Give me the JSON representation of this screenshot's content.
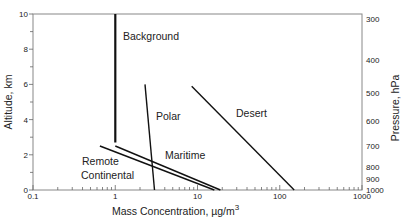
{
  "chart_data": {
    "type": "line",
    "title": "",
    "xlabel": "Mass Concentration, µg/m",
    "xlabel_superscript": "3",
    "ylabel": "Altitude, km",
    "y2label": "Pressure, hPa",
    "xscale": "log",
    "xlim": [
      0.1,
      1000
    ],
    "ylim": [
      0,
      10
    ],
    "grid": false,
    "legend": "none (inline labels)",
    "x_ticks": [
      {
        "value": 0.1,
        "label": "0.1"
      },
      {
        "value": 1,
        "label": "1"
      },
      {
        "value": 10,
        "label": "10"
      },
      {
        "value": 100,
        "label": "100"
      },
      {
        "value": 1000,
        "label": "1000"
      }
    ],
    "y_ticks": [
      {
        "value": 0,
        "label": "0"
      },
      {
        "value": 2,
        "label": "2"
      },
      {
        "value": 4,
        "label": "4"
      },
      {
        "value": 6,
        "label": "6"
      },
      {
        "value": 8,
        "label": "8"
      },
      {
        "value": 10,
        "label": "10"
      }
    ],
    "y2_ticks": [
      {
        "altitude_km": 9.7,
        "label": "300"
      },
      {
        "altitude_km": 7.4,
        "label": "400"
      },
      {
        "altitude_km": 5.5,
        "label": "500"
      },
      {
        "altitude_km": 3.9,
        "label": "600"
      },
      {
        "altitude_km": 2.5,
        "label": "700"
      },
      {
        "altitude_km": 1.3,
        "label": "800"
      },
      {
        "altitude_km": 0.6,
        "label": "900"
      },
      {
        "altitude_km": 0.0,
        "label": "1000"
      }
    ],
    "series": [
      {
        "name": "Background",
        "points": [
          [
            1.0,
            10.0
          ],
          [
            1.0,
            2.7
          ]
        ],
        "label_pos": {
          "x": 123,
          "y": 40
        }
      },
      {
        "name": "Polar",
        "points": [
          [
            2.3,
            6.0
          ],
          [
            3.0,
            0.0
          ]
        ],
        "label_pos": {
          "x": 156,
          "y": 120
        }
      },
      {
        "name": "Desert",
        "points": [
          [
            8.5,
            5.9
          ],
          [
            150.0,
            0.0
          ]
        ],
        "label_pos": {
          "x": 236,
          "y": 117
        }
      },
      {
        "name": "Maritime",
        "points": [
          [
            1.0,
            2.5
          ],
          [
            19.0,
            0.0
          ]
        ],
        "label_pos": {
          "x": 165,
          "y": 159
        }
      },
      {
        "name": "Remote Continental",
        "points": [
          [
            0.65,
            2.5
          ],
          [
            16.0,
            0.0
          ]
        ],
        "label_pos": {
          "x": 81,
          "y": 165
        },
        "label_lines": [
          "Remote",
          "Continental"
        ]
      }
    ]
  },
  "labels": {
    "background": "Background",
    "polar": "Polar",
    "desert": "Desert",
    "maritime": "Maritime",
    "remote": "Remote",
    "continental": "Continental",
    "xlabel": "Mass Concentration, µg/m",
    "xlabel_sup": "3",
    "ylabel": "Altitude, km",
    "y2label": "Pressure, hPa"
  }
}
